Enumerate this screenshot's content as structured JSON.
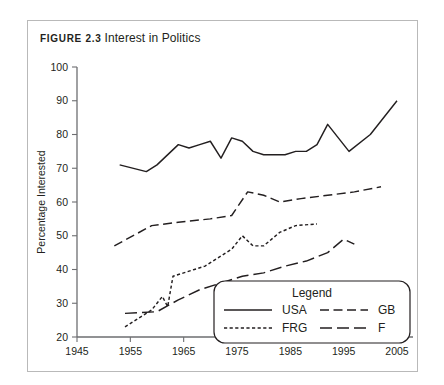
{
  "figure": {
    "label": "FIGURE 2.3",
    "title": "Interest in Politics"
  },
  "colors": {
    "ink": "#231f20",
    "axis": "#6d6e71",
    "frame": "#b9b9b9",
    "background": "#ffffff"
  },
  "chart_data": {
    "type": "line",
    "title": "Interest in Politics",
    "xlabel": "",
    "ylabel": "Percentage Interested",
    "xlim": [
      1945,
      2008
    ],
    "ylim": [
      20,
      100
    ],
    "xticks": [
      1945,
      1955,
      1965,
      1975,
      1985,
      1995,
      2005
    ],
    "yticks": [
      20,
      30,
      40,
      50,
      60,
      70,
      80,
      90,
      100
    ],
    "grid": false,
    "legend": {
      "title": "Legend",
      "position": "inside-bottom-right",
      "entries": [
        {
          "name": "USA",
          "dash": "solid"
        },
        {
          "name": "GB",
          "dash": "dashed"
        },
        {
          "name": "FRG",
          "dash": "dotted"
        },
        {
          "name": "F",
          "dash": "dash-dot-long"
        }
      ]
    },
    "series": [
      {
        "name": "USA",
        "dash": "solid",
        "x": [
          1953,
          1958,
          1960,
          1964,
          1966,
          1968,
          1970,
          1972,
          1974,
          1976,
          1978,
          1980,
          1982,
          1984,
          1986,
          1988,
          1990,
          1992,
          1996,
          2000,
          2005
        ],
        "values": [
          71,
          69,
          71,
          77,
          76,
          77,
          78,
          73,
          79,
          78,
          75,
          74,
          74,
          74,
          75,
          75,
          77,
          83,
          75,
          80,
          90
        ]
      },
      {
        "name": "GB",
        "dash": "dashed",
        "x": [
          1952,
          1959,
          1964,
          1970,
          1974,
          1977,
          1980,
          1983,
          1987,
          1992,
          1997,
          2002
        ],
        "values": [
          47,
          53,
          54,
          55,
          56,
          63,
          62,
          60,
          61,
          62,
          63,
          64.5
        ]
      },
      {
        "name": "FRG",
        "dash": "dotted",
        "x": [
          1954,
          1959,
          1961,
          1962,
          1963,
          1965,
          1967,
          1969,
          1972,
          1974,
          1976,
          1978,
          1980,
          1983,
          1986,
          1990
        ],
        "values": [
          23,
          28,
          32,
          29,
          38,
          39,
          40,
          41,
          44,
          46,
          50,
          47,
          47,
          51,
          53,
          53.5
        ]
      },
      {
        "name": "F",
        "dash": "dash-dot-long",
        "x": [
          1954,
          1960,
          1964,
          1968,
          1972,
          1976,
          1980,
          1984,
          1988,
          1992,
          1995,
          1997
        ],
        "values": [
          27,
          27.5,
          31,
          34,
          36,
          38,
          39,
          41,
          42.5,
          45,
          49,
          47.5
        ]
      }
    ]
  }
}
